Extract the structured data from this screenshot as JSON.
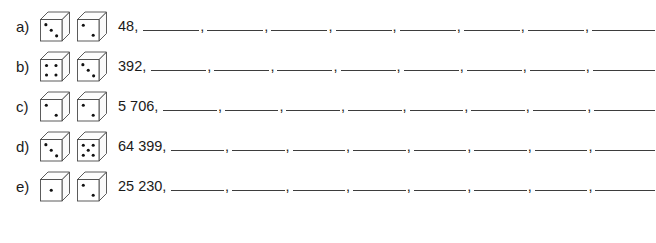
{
  "worksheet": {
    "type": "number-sequence-worksheet",
    "row_count": 5,
    "blanks_per_row": 8,
    "line_color": "#3d3d3d",
    "text_color": "#1a1a1a",
    "rows": [
      {
        "label": "a)",
        "seed": "48,",
        "seed_value": "48",
        "dice": [
          3,
          2
        ],
        "blanks": 8,
        "separator": ","
      },
      {
        "label": "b)",
        "seed": "392,",
        "seed_value": "392",
        "dice": [
          4,
          3
        ],
        "blanks": 8,
        "separator": ","
      },
      {
        "label": "c)",
        "seed": "5 706,",
        "seed_value": "5 706",
        "dice": [
          2,
          2
        ],
        "blanks": 8,
        "separator": ","
      },
      {
        "label": "d)",
        "seed": "64 399,",
        "seed_value": "64 399",
        "dice": [
          3,
          5
        ],
        "blanks": 8,
        "separator": ","
      },
      {
        "label": "e)",
        "seed": "25 230,",
        "seed_value": "25 230",
        "dice": [
          1,
          2
        ],
        "blanks": 8,
        "separator": ","
      }
    ]
  }
}
